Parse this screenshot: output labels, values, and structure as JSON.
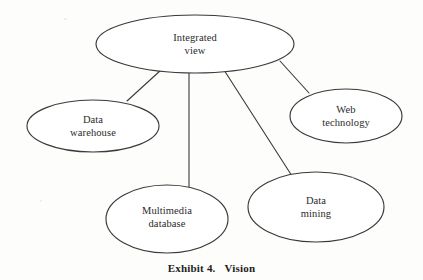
{
  "figure": {
    "caption_label": "Exhibit 4.",
    "caption_title": "Vision",
    "style": {
      "stroke_color": "#3a3a3a",
      "text_color": "#2b2b2b",
      "background_color": "#fdfdfc",
      "stroke_width": 1.1
    }
  },
  "chart_data": {
    "type": "diagram",
    "nodes": [
      {
        "id": "integrated-view",
        "label_lines": [
          "Integrated",
          "view"
        ],
        "shape": "ellipse",
        "cx": 195,
        "cy": 44,
        "rx": 99,
        "ry": 29
      },
      {
        "id": "data-warehouse",
        "label_lines": [
          "Data",
          "warehouse"
        ],
        "shape": "ellipse",
        "cx": 93,
        "cy": 126,
        "rx": 66,
        "ry": 26
      },
      {
        "id": "web-technology",
        "label_lines": [
          "Web",
          "technology"
        ],
        "shape": "ellipse",
        "cx": 346,
        "cy": 116,
        "rx": 56,
        "ry": 27
      },
      {
        "id": "multimedia-database",
        "label_lines": [
          "Multimedia",
          "database"
        ],
        "shape": "ellipse",
        "cx": 167,
        "cy": 219,
        "rx": 61,
        "ry": 34
      },
      {
        "id": "data-mining",
        "label_lines": [
          "Data",
          "mining"
        ],
        "shape": "ellipse",
        "cx": 316,
        "cy": 207,
        "rx": 68,
        "ry": 35
      }
    ],
    "edges": [
      {
        "id": "edge-integrated-warehouse",
        "from": "integrated-view",
        "to": "data-warehouse",
        "x1": 161,
        "y1": 70,
        "x2": 127,
        "y2": 101
      },
      {
        "id": "edge-integrated-multimedia",
        "from": "integrated-view",
        "to": "multimedia-database",
        "x1": 189,
        "y1": 72,
        "x2": 189,
        "y2": 187
      },
      {
        "id": "edge-integrated-mining",
        "from": "integrated-view",
        "to": "data-mining",
        "x1": 224,
        "y1": 70,
        "x2": 292,
        "y2": 176
      },
      {
        "id": "edge-integrated-web",
        "from": "integrated-view",
        "to": "web-technology",
        "x1": 280,
        "y1": 61,
        "x2": 309,
        "y2": 93
      }
    ]
  }
}
